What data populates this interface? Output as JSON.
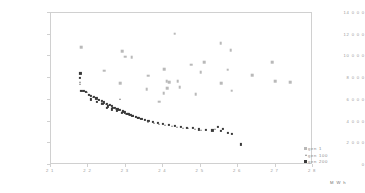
{
  "chart_data": {
    "type": "scatter",
    "title": "",
    "xlabel": "M W h",
    "ylabel": "cost ($)",
    "xlim": [
      2.1,
      2.8
    ],
    "ylim": [
      0,
      14000
    ],
    "xticks": [
      "2 1",
      "2 2",
      "2 3",
      "2 4",
      "2 5",
      "2 6",
      "2 7",
      "2 8"
    ],
    "xtick_values": [
      2.1,
      2.2,
      2.3,
      2.4,
      2.5,
      2.6,
      2.7,
      2.8
    ],
    "yticks": [
      "14 0 0 0",
      "12 0 0 0",
      "10 0 0 0",
      "8 0 0 0",
      "6 0 0 0",
      "4 0 0 0",
      "2 0 0 0",
      "0"
    ],
    "ytick_values": [
      14000,
      12000,
      10000,
      8000,
      6000,
      4000,
      2000,
      0
    ],
    "grid": false,
    "legend_position": "right-outside",
    "series": [
      {
        "name": "gen 1",
        "marker": "square",
        "color": "#b9b9b9",
        "points": [
          [
            2.183,
            10750
          ],
          [
            2.245,
            8600
          ],
          [
            2.293,
            10400
          ],
          [
            2.301,
            9900
          ],
          [
            2.318,
            9850
          ],
          [
            2.288,
            7450
          ],
          [
            2.362,
            8150
          ],
          [
            2.358,
            6900
          ],
          [
            2.405,
            8750
          ],
          [
            2.412,
            7650
          ],
          [
            2.418,
            7550
          ],
          [
            2.404,
            6500
          ],
          [
            2.413,
            7000
          ],
          [
            2.433,
            12000
          ],
          [
            2.441,
            7600
          ],
          [
            2.447,
            7050
          ],
          [
            2.478,
            9150
          ],
          [
            2.489,
            6450
          ],
          [
            2.503,
            8450
          ],
          [
            2.512,
            9350
          ],
          [
            2.556,
            11150
          ],
          [
            2.558,
            7450
          ],
          [
            2.575,
            8700
          ],
          [
            2.583,
            10500
          ],
          [
            2.586,
            6750
          ],
          [
            2.641,
            8200
          ],
          [
            2.694,
            9350
          ],
          [
            2.702,
            7650
          ],
          [
            2.742,
            7550
          ],
          [
            2.391,
            5750
          ]
        ]
      },
      {
        "name": "gen 100",
        "marker": "triangle",
        "color": "#8e8e8e",
        "points": [
          [
            2.182,
            8350
          ],
          [
            2.18,
            7550
          ],
          [
            2.179,
            7400
          ],
          [
            2.186,
            6750
          ],
          [
            2.192,
            6700
          ],
          [
            2.198,
            6600
          ],
          [
            2.206,
            6350
          ],
          [
            2.214,
            6200
          ],
          [
            2.222,
            6050
          ],
          [
            2.231,
            5900
          ],
          [
            2.24,
            5700
          ],
          [
            2.249,
            5550
          ],
          [
            2.258,
            5400
          ],
          [
            2.266,
            5250
          ],
          [
            2.275,
            5100
          ],
          [
            2.284,
            4950
          ],
          [
            2.293,
            4800
          ],
          [
            2.302,
            4650
          ],
          [
            2.311,
            4500
          ],
          [
            2.286,
            5950
          ],
          [
            2.33,
            4350
          ],
          [
            2.345,
            4150
          ],
          [
            2.362,
            3900
          ],
          [
            2.378,
            3750
          ],
          [
            2.392,
            3700
          ],
          [
            2.408,
            3600
          ],
          [
            2.425,
            3500
          ],
          [
            2.44,
            3400
          ],
          [
            2.455,
            3350
          ],
          [
            2.47,
            3300
          ],
          [
            2.487,
            3250
          ],
          [
            2.503,
            3150
          ],
          [
            2.54,
            3250
          ]
        ]
      },
      {
        "name": "gen 200",
        "marker": "square",
        "color": "#3a3a3a",
        "points": [
          [
            2.181,
            8350
          ],
          [
            2.18,
            7950
          ],
          [
            2.184,
            6750
          ],
          [
            2.19,
            6700
          ],
          [
            2.196,
            6620
          ],
          [
            2.203,
            6400
          ],
          [
            2.21,
            6250
          ],
          [
            2.217,
            6150
          ],
          [
            2.224,
            6050
          ],
          [
            2.231,
            5920
          ],
          [
            2.238,
            5800
          ],
          [
            2.245,
            5680
          ],
          [
            2.252,
            5560
          ],
          [
            2.259,
            5440
          ],
          [
            2.266,
            5320
          ],
          [
            2.273,
            5200
          ],
          [
            2.28,
            5100
          ],
          [
            2.287,
            5000
          ],
          [
            2.294,
            4880
          ],
          [
            2.301,
            4760
          ],
          [
            2.308,
            4650
          ],
          [
            2.315,
            4550
          ],
          [
            2.322,
            4450
          ],
          [
            2.329,
            4350
          ],
          [
            2.336,
            4250
          ],
          [
            2.344,
            4150
          ],
          [
            2.353,
            4050
          ],
          [
            2.363,
            3950
          ],
          [
            2.374,
            3850
          ],
          [
            2.388,
            3750
          ],
          [
            2.402,
            3680
          ],
          [
            2.418,
            3580
          ],
          [
            2.434,
            3500
          ],
          [
            2.45,
            3420
          ],
          [
            2.466,
            3350
          ],
          [
            2.482,
            3300
          ],
          [
            2.498,
            3180
          ],
          [
            2.516,
            3150
          ],
          [
            2.534,
            3100
          ],
          [
            2.556,
            3050
          ],
          [
            2.575,
            2900
          ],
          [
            2.548,
            3400
          ],
          [
            2.562,
            3250
          ],
          [
            2.585,
            2800
          ],
          [
            2.61,
            1800
          ],
          [
            2.21,
            5950
          ],
          [
            2.226,
            5750
          ],
          [
            2.24,
            5500
          ],
          [
            2.254,
            5300
          ],
          [
            2.268,
            5150
          ],
          [
            2.282,
            4950
          ],
          [
            2.296,
            4800
          ],
          [
            2.31,
            4600
          ],
          [
            2.252,
            5180
          ],
          [
            2.265,
            5020
          ],
          [
            2.278,
            4880
          ],
          [
            2.292,
            4720
          ],
          [
            2.306,
            4580
          ],
          [
            2.32,
            4420
          ],
          [
            2.334,
            4280
          ]
        ]
      }
    ]
  },
  "legend": {
    "items": [
      {
        "label": "gen 1"
      },
      {
        "label": "gen 100"
      },
      {
        "label": "gen 200"
      }
    ]
  }
}
